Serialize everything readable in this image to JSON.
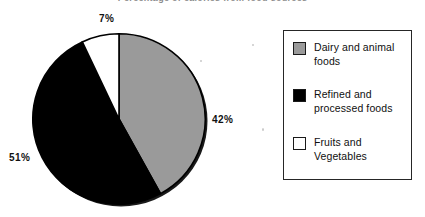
{
  "chart": {
    "title": "Percentage of calories from food sources"
  },
  "legend": {
    "items": [
      {
        "label": "Dairy and animal foods",
        "swatch": "#9a9a9a",
        "name": "legend-swatch-dairy"
      },
      {
        "label": "Refined and processed foods",
        "swatch": "#000000",
        "name": "legend-swatch-refined"
      },
      {
        "label": "Fruits and Vegetables",
        "swatch": "#ffffff",
        "name": "legend-swatch-fruits"
      }
    ]
  },
  "labels": {
    "fruits": "7%",
    "dairy": "42%",
    "refined": "51%"
  },
  "chart_data": {
    "type": "pie",
    "title": "Percentage of calories from food sources",
    "categories": [
      "Dairy and animal foods",
      "Refined and processed foods",
      "Fruits and Vegetables"
    ],
    "values": [
      42,
      51,
      7
    ],
    "value_labels": [
      "42%",
      "51%",
      "7%"
    ],
    "colors": [
      "#9a9a9a",
      "#000000",
      "#ffffff"
    ],
    "edge_color": "#000000",
    "start_angle_deg": 0,
    "direction": "clockwise",
    "legend_position": "right",
    "grid": false,
    "units": "percent"
  }
}
